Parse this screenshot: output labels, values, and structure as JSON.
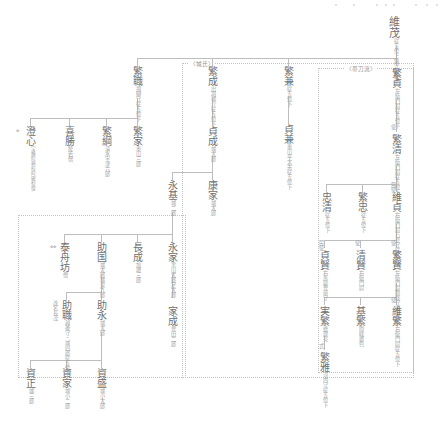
{
  "document": {
    "kind": "japanese-genealogy-chart",
    "title": "維茂系図",
    "root_label": "維茂"
  },
  "groups": [
    {
      "id": "jo-shi",
      "label": "〈城氏〉"
    },
    {
      "id": "tatewaki",
      "label": "〈帯刀流〉"
    }
  ],
  "nodes": {
    "koremochi": {
      "name": "維茂",
      "annotations": [
        "従五位上",
        "鎮守府将軍"
      ]
    },
    "shigemoto": {
      "name": "繁職",
      "annotations": [
        "従五位下",
        "飛騨守"
      ]
    },
    "shigenari": {
      "name": "繁成",
      "annotations": [
        "従五位下",
        "出羽城介"
      ]
    },
    "shigekane": {
      "name": "繁兼",
      "annotations": [
        "従五位下"
      ]
    },
    "shigesada": {
      "name": "繁貞",
      "annotations": [
        "従五位下",
        "左衛門尉"
      ]
    },
    "shigeie": {
      "name": "繁家",
      "annotations": [
        "奥山三郎"
      ]
    },
    "shigetsuna": {
      "name": "繁綱",
      "annotations": [
        "清水",
        "宇津六郎"
      ]
    },
    "yoshikatsu": {
      "name": "喜勝",
      "annotations": [
        "僧",
        "陸若"
      ]
    },
    "choshin": {
      "name": "澄心",
      "annotations": [
        "僧",
        "阿闍梨",
        "宝輪院頼校"
      ],
      "marker": "※"
    },
    "sadanari": {
      "name": "貞成",
      "annotations": [
        "城太郎"
      ]
    },
    "sadakane": {
      "name": "貞兼",
      "annotations": [
        "従五位下",
        "奥山平太夫"
      ]
    },
    "shigekiyo": {
      "name": "繁清",
      "annotations": [
        "従五位下",
        "左衛門尉"
      ],
      "prefix": "使"
    },
    "yasuie": {
      "name": "康家",
      "annotations": [
        "城太郎"
      ]
    },
    "nagamoto": {
      "name": "永基",
      "annotations": [
        "城二郎"
      ]
    },
    "koresada": {
      "name": "維貞",
      "annotations": [
        "従五位下",
        "石見守",
        "右衛門尉"
      ],
      "prefix": "民使"
    },
    "shigetada": {
      "name": "繁忠",
      "annotations": [
        "従五位下"
      ]
    },
    "tadakiyo": {
      "name": "忠清",
      "annotations": [
        "従五位下"
      ]
    },
    "nagaie": {
      "name": "永家",
      "annotations": [
        "足太郎",
        "黒山太郎"
      ]
    },
    "naganari": {
      "name": "長成",
      "annotations": [
        "加地三郎"
      ]
    },
    "sukekuni": {
      "name": "助国",
      "annotations": [
        "城鬼九郎",
        "城太郎"
      ]
    },
    "taishubo": {
      "name": "泰舟坊",
      "annotations": [
        "僧"
      ],
      "marker": "※※"
    },
    "shigekata": {
      "name": "繁賢",
      "annotations": [
        "従五位下",
        "隠岐守",
        "左衛門尉"
      ],
      "prefix": "使"
    },
    "kiyokata": {
      "name": "清賢",
      "annotations": [
        "右衛門尉"
      ],
      "prefix": "使"
    },
    "sadakata": {
      "name": "貞賢",
      "annotations": [
        "豊前守",
        "右馬助"
      ],
      "prefix": "民使"
    },
    "sukenaga": {
      "name": "助永",
      "annotations": [
        "城太郎"
      ]
    },
    "sukemoto": {
      "name": "助職",
      "annotations": [
        "従五位下",
        "越後守・城四郎"
      ],
      "note": "改名長茂"
    },
    "ienari": {
      "name": "家成",
      "annotations": [
        "豊田二郎"
      ]
    },
    "koreshige": {
      "name": "維繁",
      "annotations": [
        "従五位下",
        "右衛門尉"
      ],
      "prefix": "使"
    },
    "motoshige": {
      "name": "基繁",
      "annotations": [
        "隠岐雑色"
      ]
    },
    "sanenari": {
      "name": "実繁",
      "annotations": [
        "修理亮"
      ]
    },
    "shigemasa": {
      "name": "繁雅",
      "annotations": [
        "従五位下",
        "河内守"
      ],
      "prefix": "式"
    },
    "sukemori": {
      "name": "資盛",
      "annotations": [
        "城小太郎"
      ]
    },
    "sukeie": {
      "name": "資家",
      "annotations": [
        "城小二郎"
      ]
    },
    "sukemasa": {
      "name": "資正",
      "annotations": [
        "城三郎"
      ]
    }
  },
  "colors": {
    "ink": "#6f6f6f",
    "annotation": "#a3a3a3",
    "line": "#bdbdbd",
    "group_border": "#c2c2c2",
    "background": "#ffffff"
  }
}
